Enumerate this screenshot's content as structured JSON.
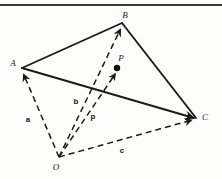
{
  "figure": {
    "name": "vector-tetrahedron-diagram",
    "background_color": "#fdfdfc",
    "ink_color": "#1a1a1a",
    "top_rule": {
      "name": "top-border-rule",
      "x1": 0,
      "y1": 5,
      "x2": 222,
      "y2": 5,
      "color": "#3a3a3a",
      "width": 2
    }
  },
  "points": {
    "A": {
      "label": "A",
      "x": 22,
      "y": 68,
      "label_x": 13,
      "label_y": 65
    },
    "B": {
      "label": "B",
      "x": 122,
      "y": 23,
      "label_x": 125,
      "label_y": 18
    },
    "C": {
      "label": "C",
      "x": 196,
      "y": 118,
      "label_x": 203,
      "label_y": 118
    },
    "O": {
      "label": "O",
      "x": 59,
      "y": 157,
      "label_x": 55,
      "label_y": 169
    },
    "P": {
      "label": "P",
      "x": 117,
      "y": 68,
      "label_x": 121,
      "label_y": 61,
      "dot_radius": 3.2
    }
  },
  "edges": [
    {
      "name": "edge-A-B",
      "from": "A",
      "to": "B",
      "style": "solid",
      "arrow": false
    },
    {
      "name": "edge-B-C",
      "from": "B",
      "to": "C",
      "style": "solid",
      "arrow": false
    },
    {
      "name": "edge-A-C",
      "from": "A",
      "to": "C",
      "style": "solid",
      "arrow": true
    }
  ],
  "vectors": [
    {
      "name": "vector-O-A",
      "from": "O",
      "to": "A",
      "style": "dashed",
      "arrow": true,
      "label": "a",
      "label_x": 28,
      "label_y": 121
    },
    {
      "name": "vector-O-B",
      "from": "O",
      "to": "B",
      "style": "dashed",
      "arrow": true,
      "label": "b",
      "label_x": 76,
      "label_y": 103
    },
    {
      "name": "vector-O-P",
      "from": "O",
      "to": "P",
      "style": "dashed-solid",
      "arrow": true,
      "label": "p",
      "label_x": 93,
      "label_y": 118
    },
    {
      "name": "vector-O-C",
      "from": "O",
      "to": "C",
      "style": "dashed",
      "arrow": true,
      "label": "c",
      "label_x": 122,
      "label_y": 152
    }
  ],
  "labels": {
    "vertices": [
      "A",
      "B",
      "C",
      "O",
      "P"
    ],
    "vectors": [
      "a",
      "b",
      "p",
      "c"
    ]
  }
}
